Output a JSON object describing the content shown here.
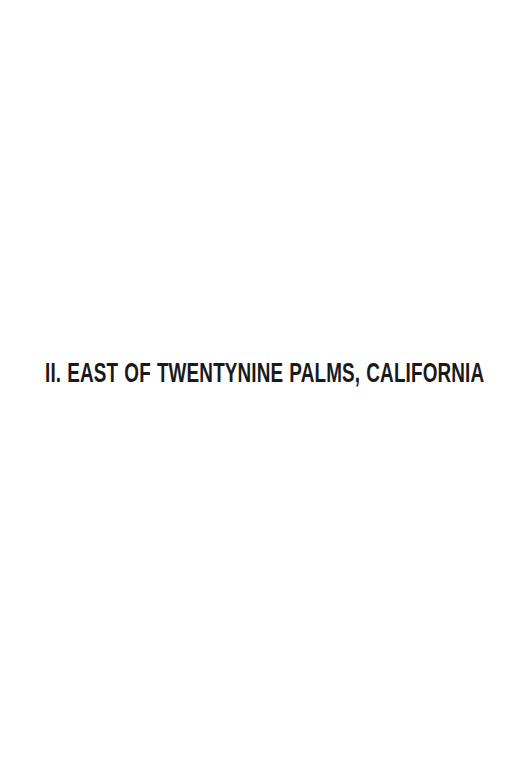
{
  "page": {
    "background_color": "#ffffff",
    "text_color": "#1a1a1a",
    "width": 530,
    "height": 765,
    "type": "part-title-page"
  },
  "heading": {
    "full_text": "II. EAST OF TWENTYNINE PALMS, CALIFORNIA",
    "part_number": "II.",
    "part_name": "EAST OF TWENTYNINE PALMS, CALIFORNIA",
    "place": "Twentynine Palms",
    "state": "California"
  }
}
